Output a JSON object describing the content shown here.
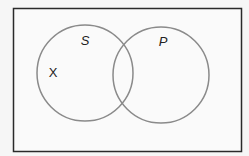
{
  "diagram": {
    "type": "venn",
    "universe": {
      "x": 13,
      "y": 8,
      "width": 229,
      "height": 144,
      "stroke": "#2a2a2a"
    },
    "sets": [
      {
        "name": "S",
        "cx": 85,
        "cy": 73,
        "r": 48,
        "label_x": 85,
        "label_y": 45
      },
      {
        "name": "P",
        "cx": 161,
        "cy": 75,
        "r": 48,
        "label_x": 163,
        "label_y": 46
      }
    ],
    "marks": [
      {
        "text": "X",
        "x": 53,
        "y": 77,
        "region": "S only"
      }
    ],
    "circle_stroke": "#8a8a8a",
    "background": "#f6f6f6"
  }
}
